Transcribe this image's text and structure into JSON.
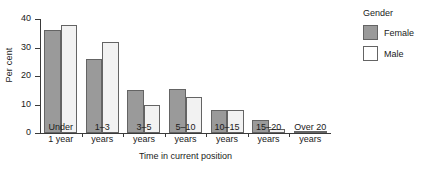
{
  "chart_data": {
    "type": "bar",
    "title": "",
    "xlabel": "Time in current position",
    "ylabel": "Per cent",
    "categories": [
      "Under\n1 year",
      "1–3\nyears",
      "3–5\nyears",
      "5–10\nyears",
      "10–15\nyears",
      "15–20\nyears",
      "Over 20\nyears"
    ],
    "category_lines": [
      [
        "Under",
        "1 year"
      ],
      [
        "1–3",
        "years"
      ],
      [
        "3–5",
        "years"
      ],
      [
        "5–10",
        "years"
      ],
      [
        "10–15",
        "years"
      ],
      [
        "15–20",
        "years"
      ],
      [
        "Over 20",
        "years"
      ]
    ],
    "series": [
      {
        "name": "Female",
        "color": "#9a9a9a",
        "values": [
          36,
          26,
          15,
          15.5,
          8,
          4.5,
          0.8
        ]
      },
      {
        "name": "Male",
        "color": "#f2f2f2",
        "values": [
          38,
          32,
          10,
          12.5,
          8,
          1.5,
          0.8
        ]
      }
    ],
    "ylim": [
      0,
      40
    ],
    "yticks": [
      0,
      10,
      20,
      30,
      40
    ],
    "ytick_labels": [
      "0",
      "10",
      "20",
      "30",
      "40"
    ],
    "grid": false,
    "legend_position": "right",
    "legend_title": "Gender"
  },
  "legend": {
    "title": "Gender",
    "entries": [
      {
        "label": "Female",
        "swatch": "female"
      },
      {
        "label": "Male",
        "swatch": "male"
      }
    ]
  },
  "axes": {
    "y_title": "Per cent",
    "x_title": "Time in current position"
  }
}
